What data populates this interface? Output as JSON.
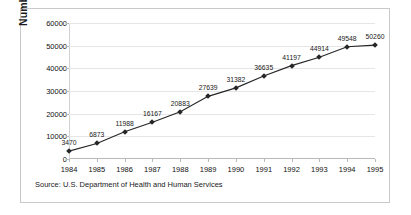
{
  "chart_data": {
    "type": "line",
    "title": "",
    "xlabel": "",
    "ylabel": "Number of Deaths",
    "categories": [
      "1984",
      "1985",
      "1986",
      "1987",
      "1988",
      "1989",
      "1990",
      "1991",
      "1992",
      "1993",
      "1994",
      "1995"
    ],
    "values": [
      3470,
      6873,
      11988,
      16167,
      20883,
      27639,
      31382,
      36635,
      41197,
      44914,
      49548,
      50260
    ],
    "data_labels": [
      "3470",
      "6873",
      "11988",
      "16167",
      "20883",
      "27639",
      "31382",
      "36635",
      "41197",
      "44914",
      "49548",
      "50260"
    ],
    "ylim": [
      0,
      60000
    ],
    "ytick_values": [
      0,
      10000,
      20000,
      30000,
      40000,
      50000,
      60000
    ],
    "ytick_labels": [
      "0",
      "10000",
      "20000",
      "30000",
      "40000",
      "50000",
      "60000"
    ],
    "grid": true,
    "legend": "none",
    "marker": "diamond",
    "line_color": "#262626",
    "marker_color": "#262626",
    "grid_color": "#e6e6e6",
    "axis_color": "#b9b9b9"
  },
  "footer": {
    "source": "Source: U.S. Department of Health and Human Services"
  }
}
